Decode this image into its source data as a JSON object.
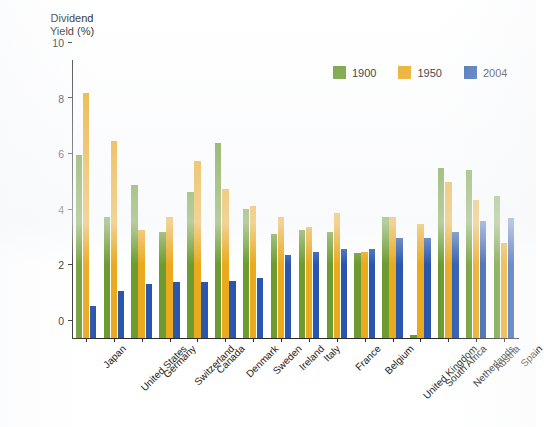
{
  "chart_data": {
    "type": "bar",
    "title": "",
    "xlabel": "",
    "ylabel": "Dividend\nYield (%)",
    "ylim": [
      0,
      10
    ],
    "yticks": [
      0,
      2,
      4,
      6,
      8,
      10
    ],
    "grid": false,
    "legend_position": "top-right",
    "categories": [
      "Japan",
      "United States",
      "Germany",
      "Switzerland",
      "Canada",
      "Denmark",
      "Sweden",
      "Ireland",
      "Italy",
      "France",
      "Belgium",
      "United Kingdom",
      "South Africa",
      "Netherlands",
      "Austria",
      "Spain"
    ],
    "series": [
      {
        "name": "1900",
        "color": "#6d9b2f",
        "values": [
          6.6,
          4.35,
          5.5,
          3.8,
          5.25,
          7.0,
          4.65,
          3.75,
          3.9,
          3.8,
          3.05,
          4.35,
          0.1,
          6.1,
          6.05,
          5.1
        ]
      },
      {
        "name": "1950",
        "color": "#eba91d",
        "values": [
          8.8,
          7.1,
          3.9,
          4.35,
          6.35,
          5.35,
          4.75,
          4.35,
          4.0,
          4.5,
          3.1,
          4.35,
          4.1,
          5.6,
          4.95,
          3.4
        ]
      },
      {
        "name": "2004",
        "color": "#2a57ad",
        "values": [
          1.15,
          1.7,
          1.95,
          2.0,
          2.0,
          2.05,
          2.15,
          3.0,
          3.1,
          3.2,
          3.2,
          3.6,
          3.6,
          3.8,
          4.2,
          4.3
        ]
      }
    ]
  },
  "axis": {
    "y_title": "Dividend\nYield (%)"
  }
}
